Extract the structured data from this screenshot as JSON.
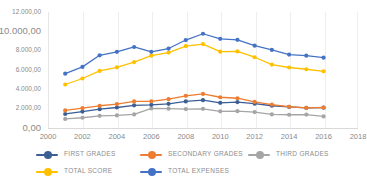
{
  "chart_data": {
    "type": "line",
    "title": "",
    "subtitle": "",
    "xlabel": "",
    "ylabel": "",
    "xlim": [
      2000,
      2018
    ],
    "ylim": [
      0,
      12000
    ],
    "grid": "vertical",
    "legend_position": "bottom",
    "x": [
      2001,
      2002,
      2003,
      2004,
      2005,
      2006,
      2007,
      2008,
      2009,
      2010,
      2011,
      2012,
      2013,
      2014,
      2015,
      2016
    ],
    "series": [
      {
        "name": "FIRST GRADES",
        "color": "#3B5E95",
        "values": [
          1450,
          1700,
          1950,
          2120,
          2350,
          2400,
          2500,
          2750,
          2880,
          2600,
          2680,
          2520,
          2300,
          2180,
          2080,
          2100
        ]
      },
      {
        "name": "SECONDARY GRADES",
        "color": "#ED7D31",
        "values": [
          1820,
          2050,
          2300,
          2480,
          2750,
          2760,
          2980,
          3330,
          3520,
          3180,
          3080,
          2700,
          2420,
          2200,
          2080,
          2120
        ]
      },
      {
        "name": "THIRD GRADES",
        "color": "#A5A5A5",
        "values": [
          940,
          1060,
          1260,
          1300,
          1400,
          2020,
          2000,
          1960,
          1980,
          1720,
          1740,
          1650,
          1400,
          1370,
          1390,
          1200
        ]
      },
      {
        "name": "TOTAL SCORE",
        "color": "#FFC000",
        "values": [
          4500,
          5120,
          5900,
          6280,
          6820,
          7480,
          7800,
          8480,
          8680,
          7900,
          7920,
          7320,
          6560,
          6260,
          6080,
          5860
        ]
      },
      {
        "name": "TOTAL EXPENSES",
        "color": "#4472C4",
        "values": [
          5620,
          6320,
          7520,
          7880,
          8380,
          7880,
          8220,
          9100,
          9750,
          9220,
          9120,
          8520,
          8080,
          7600,
          7480,
          7280
        ]
      }
    ],
    "y_ticks": [
      {
        "label": "12.000,00",
        "value": 12000
      },
      {
        "label": "10.000,00",
        "value": 10000
      },
      {
        "label": "8.000,00",
        "value": 8000
      },
      {
        "label": "6.000,00",
        "value": 6000
      },
      {
        "label": "4.000,00",
        "value": 4000
      },
      {
        "label": "2.000,00",
        "value": 2000
      },
      {
        "label": "0,00",
        "value": 0
      }
    ],
    "x_ticks": [
      {
        "label": "2000",
        "value": 2000
      },
      {
        "label": "2002",
        "value": 2002
      },
      {
        "label": "2004",
        "value": 2004
      },
      {
        "label": "2006",
        "value": 2006
      },
      {
        "label": "2008",
        "value": 2008
      },
      {
        "label": "2010",
        "value": 2010
      },
      {
        "label": "2012",
        "value": 2012
      },
      {
        "label": "2014",
        "value": 2014
      },
      {
        "label": "2016",
        "value": 2016
      },
      {
        "label": "2018",
        "value": 2018
      }
    ]
  },
  "legend": {
    "row1": [
      {
        "label": "FIRST GRADES",
        "color": "#3B5E95",
        "name": "first-grades"
      },
      {
        "label": "SECONDARY GRADES",
        "color": "#ED7D31",
        "name": "secondary-grades"
      },
      {
        "label": "THIRD GRADES",
        "color": "#A5A5A5",
        "name": "third-grades"
      }
    ],
    "row2": [
      {
        "label": "TOTAL SCORE",
        "color": "#FFC000",
        "name": "total-score"
      },
      {
        "label": "TOTAL EXPENSES",
        "color": "#4472C4",
        "name": "total-expenses"
      }
    ]
  }
}
